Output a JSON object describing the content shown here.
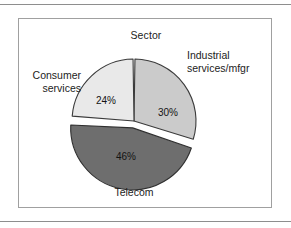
{
  "figure": {
    "title": "Sector",
    "background": "#ffffff",
    "frame_color": "#a0a0a0",
    "rule_color": "#8e8e8e"
  },
  "chart_data": {
    "type": "pie",
    "title": "Sector",
    "xlabel": "",
    "ylabel": "",
    "categories": [
      "Industrial services/mfgr",
      "Telecom",
      "Consumer services"
    ],
    "values": [
      30,
      46,
      24
    ],
    "value_labels": [
      "30%",
      "46%",
      "24%"
    ],
    "units": "percent",
    "start_angle_deg": 0,
    "direction": "clockwise",
    "exploded": [
      "Telecom"
    ],
    "legend": "none",
    "grid": false,
    "slices": [
      {
        "label": "Industrial services/mfgr",
        "label_line1": "Industrial",
        "label_line2": "services/mfgr",
        "value": 30,
        "value_label": "30%",
        "color": "#cbcbcb",
        "edge_color": "#3b3b3b",
        "text_color": "#141414",
        "exploded": false
      },
      {
        "label": "Telecom",
        "label_line1": "Telecom",
        "label_line2": "",
        "value": 46,
        "value_label": "46%",
        "color": "#6e6e6e",
        "edge_color": "#2f2f2f",
        "text_color": "#141414",
        "exploded": true
      },
      {
        "label": "Consumer services",
        "label_line1": "Consumer",
        "label_line2": "services",
        "value": 24,
        "value_label": "24%",
        "color": "#e9e9e9",
        "edge_color": "#3b3b3b",
        "text_color": "#141414",
        "exploded": false
      }
    ]
  }
}
